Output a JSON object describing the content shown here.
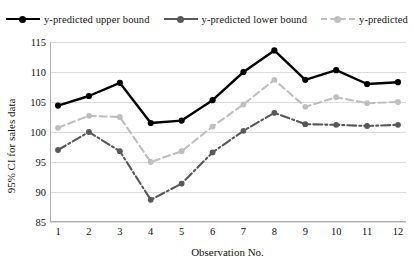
{
  "chart_data": {
    "type": "line",
    "title": "",
    "xlabel": "Observation No.",
    "ylabel": "95% CI for sales data",
    "categories": [
      "1",
      "2",
      "3",
      "4",
      "5",
      "6",
      "7",
      "8",
      "9",
      "10",
      "11",
      "12"
    ],
    "x": [
      1,
      2,
      3,
      4,
      5,
      6,
      7,
      8,
      9,
      10,
      11,
      12
    ],
    "ylim": [
      85,
      115
    ],
    "yticks": [
      85,
      90,
      95,
      100,
      105,
      110,
      115
    ],
    "grid": true,
    "legend_position": "top",
    "series": [
      {
        "name": "y-predicted upper bound",
        "color": "#000000",
        "line_style": "solid",
        "marker": "circle",
        "values": [
          104.4,
          106.0,
          108.2,
          101.5,
          101.9,
          105.3,
          110.0,
          113.6,
          108.7,
          110.3,
          108.0,
          108.3
        ]
      },
      {
        "name": "y-predicted lower bound",
        "color": "#595959",
        "line_style": "dash-dot",
        "marker": "circle",
        "values": [
          97.0,
          100.0,
          96.8,
          88.7,
          91.4,
          96.6,
          100.2,
          103.2,
          101.3,
          101.2,
          101.0,
          101.2
        ]
      },
      {
        "name": "y-predicted",
        "color": "#bfbfbf",
        "line_style": "dashed",
        "marker": "circle",
        "values": [
          100.7,
          102.7,
          102.5,
          95.0,
          96.8,
          100.9,
          104.6,
          108.7,
          104.2,
          105.8,
          104.8,
          105.0
        ]
      }
    ]
  },
  "legend": {
    "entries": [
      {
        "label": "y-predicted upper bound"
      },
      {
        "label": "y-predicted lower bound"
      },
      {
        "label": "y-predicted"
      }
    ]
  },
  "axes": {
    "y_title": "95% CI for sales data",
    "x_title": "Observation No.",
    "y_tick_labels": [
      "115",
      "110",
      "105",
      "100",
      "95",
      "90",
      "85"
    ],
    "x_tick_labels": [
      "1",
      "2",
      "3",
      "4",
      "5",
      "6",
      "7",
      "8",
      "9",
      "10",
      "11",
      "12"
    ]
  },
  "colors": {
    "upper_bound": "#000000",
    "lower_bound": "#595959",
    "predicted": "#bfbfbf",
    "gridline": "#dcdcdc",
    "background": "#ffffff"
  }
}
